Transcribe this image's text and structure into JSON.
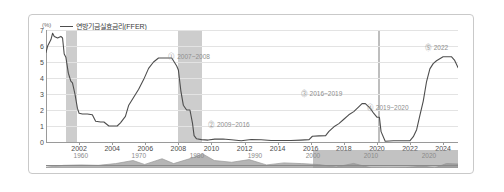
{
  "chart_data": {
    "type": "line",
    "title": "",
    "xlabel": "",
    "ylabel": "(%)",
    "yunit": "(%)",
    "ylim": [
      0,
      7
    ],
    "xlim": [
      2000.0,
      2024.9
    ],
    "grid": true,
    "legend_position": "top-left",
    "legend": [
      {
        "name": "연방기금실효금리(FFER)",
        "color": "#4d4d4d"
      }
    ],
    "yticks": [
      "0",
      "1",
      "2",
      "3",
      "4",
      "5",
      "6",
      "7"
    ],
    "ytick_values": [
      0,
      1,
      2,
      3,
      4,
      5,
      6,
      7
    ],
    "xticks": [
      "2002",
      "2004",
      "2006",
      "2008",
      "2010",
      "2012",
      "2014",
      "2016",
      "2018",
      "2020",
      "2022",
      "2024"
    ],
    "xtick_values": [
      2002,
      2004,
      2006,
      2008,
      2010,
      2012,
      2014,
      2016,
      2018,
      2020,
      2022,
      2024
    ],
    "series": [
      {
        "name": "연방기금실효금리(FFER)",
        "color": "#4d4d4d",
        "x": [
          2000.0,
          2000.1,
          2000.2,
          2000.3,
          2000.4,
          2000.5,
          2000.7,
          2000.9,
          2001.0,
          2001.1,
          2001.2,
          2001.35,
          2001.5,
          2001.6,
          2001.75,
          2001.9,
          2002.0,
          2002.2,
          2002.5,
          2002.8,
          2003.0,
          2003.3,
          2003.5,
          2003.8,
          2004.0,
          2004.3,
          2004.5,
          2004.8,
          2005.0,
          2005.3,
          2005.6,
          2005.9,
          2006.2,
          2006.5,
          2006.8,
          2007.0,
          2007.3,
          2007.6,
          2007.75,
          2007.9,
          2008.0,
          2008.15,
          2008.3,
          2008.5,
          2008.7,
          2008.85,
          2008.95,
          2009.1,
          2009.4,
          2009.8,
          2010.2,
          2010.7,
          2011.2,
          2011.8,
          2012.4,
          2013.0,
          2013.6,
          2014.2,
          2014.8,
          2015.4,
          2015.9,
          2016.1,
          2016.5,
          2016.9,
          2017.1,
          2017.4,
          2017.7,
          2018.0,
          2018.3,
          2018.6,
          2018.9,
          2019.1,
          2019.3,
          2019.6,
          2019.8,
          2020.0,
          2020.15,
          2020.25,
          2020.5,
          2021.0,
          2021.5,
          2022.0,
          2022.2,
          2022.4,
          2022.6,
          2022.8,
          2023.0,
          2023.2,
          2023.4,
          2023.6,
          2024.0,
          2024.5,
          2024.7,
          2024.9
        ],
        "y": [
          5.6,
          6.0,
          6.2,
          6.4,
          6.8,
          6.6,
          6.5,
          6.6,
          6.5,
          5.5,
          5.3,
          4.3,
          3.8,
          3.7,
          3.0,
          2.1,
          1.8,
          1.75,
          1.75,
          1.7,
          1.3,
          1.25,
          1.25,
          1.0,
          1.0,
          1.0,
          1.2,
          1.6,
          2.3,
          2.8,
          3.3,
          3.9,
          4.6,
          5.0,
          5.25,
          5.25,
          5.25,
          5.25,
          5.0,
          4.75,
          4.5,
          3.2,
          2.3,
          2.0,
          2.0,
          1.2,
          0.4,
          0.2,
          0.15,
          0.12,
          0.18,
          0.19,
          0.14,
          0.08,
          0.16,
          0.14,
          0.09,
          0.09,
          0.09,
          0.12,
          0.15,
          0.36,
          0.38,
          0.4,
          0.66,
          0.95,
          1.15,
          1.42,
          1.7,
          1.9,
          2.2,
          2.4,
          2.4,
          2.1,
          1.8,
          1.55,
          1.55,
          0.65,
          0.05,
          0.08,
          0.08,
          0.08,
          0.33,
          0.77,
          1.68,
          2.56,
          3.78,
          4.57,
          4.9,
          5.08,
          5.33,
          5.33,
          5.1,
          4.65
        ],
        "last_value": 4.65
      }
    ],
    "shaded_bands": [
      {
        "label": "recession-2001",
        "x0": 2001.2,
        "x1": 2001.85,
        "color": "#c4c4c4"
      },
      {
        "label": "recession-2007-2009",
        "x0": 2007.95,
        "x1": 2009.45,
        "color": "#c4c4c4"
      },
      {
        "label": "recession-2020",
        "x0": 2020.05,
        "x1": 2020.18,
        "color": "#b3b3b3"
      }
    ],
    "annotations": [
      {
        "id": "a1",
        "text": "⓵ 2007~2008",
        "x": 2007.4,
        "y": 5.3
      },
      {
        "id": "a2",
        "text": "⓶ 2009~2016",
        "x": 2009.8,
        "y": 1.05
      },
      {
        "id": "a3",
        "text": "⓷ 2016~2019",
        "x": 2015.4,
        "y": 3.0
      },
      {
        "id": "a4",
        "text": "⓸ 2019~2020",
        "x": 2019.4,
        "y": 2.1
      },
      {
        "id": "a5",
        "text": "⓹ 2022",
        "x": 2022.9,
        "y": 5.9
      }
    ]
  },
  "navigator": {
    "name": "range-navigator",
    "ticks": [
      "1960",
      "1970",
      "1980",
      "1990",
      "2000",
      "2010",
      "2020"
    ],
    "tick_values": [
      1960,
      1970,
      1980,
      1990,
      2000,
      2010,
      2020
    ],
    "range_start": 2000,
    "range_end": 2025,
    "full_start": 1954,
    "full_end": 2025,
    "series_color": "#9a9a9a",
    "selection_color": "#8f8f8f"
  },
  "colors": {
    "line": "#4d4d4d",
    "grid": "#e3e3e3",
    "axis": "#9a9a9a",
    "band": "#c4c4c4",
    "annotation": "#8e8e8e",
    "border": "#c9c9c9",
    "background": "#ffffff"
  }
}
